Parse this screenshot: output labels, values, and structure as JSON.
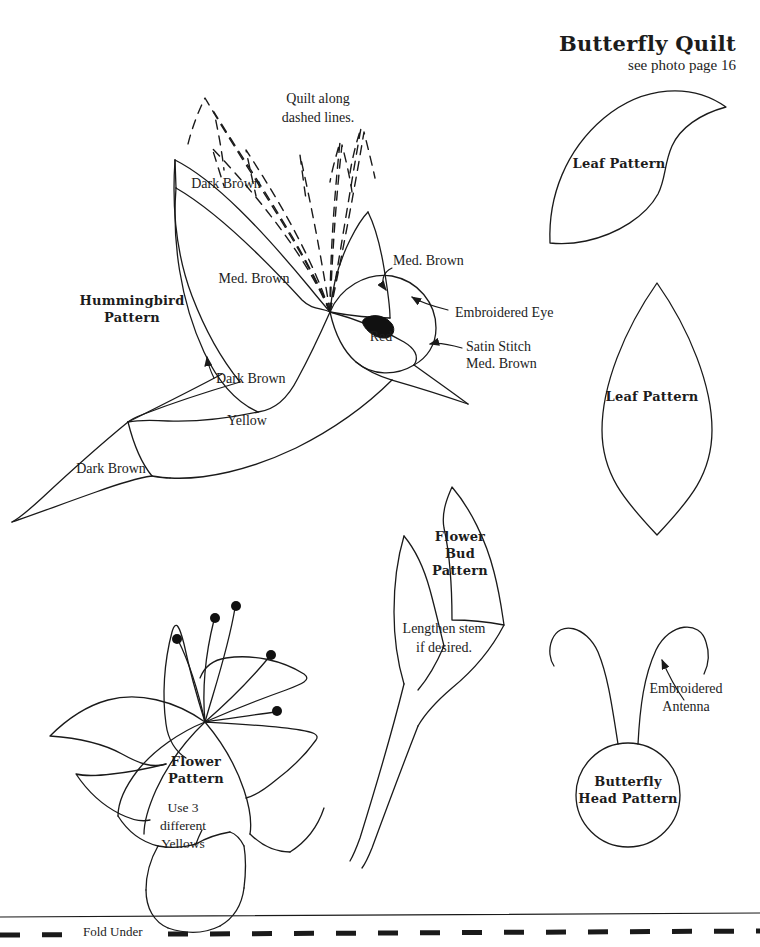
{
  "page": {
    "background": "#ffffff",
    "ink": "#1a1a1a",
    "width": 760,
    "height": 947
  },
  "header": {
    "title": "Butterfly Quilt",
    "subtitle": "see photo page 16"
  },
  "hummingbird": {
    "pattern_label_line1": "Hummingbird",
    "pattern_label_line2": "Pattern",
    "quilt_note_line1": "Quilt along",
    "quilt_note_line2": "dashed lines.",
    "wing_upper_label": "Dark Brown",
    "wing_main_label": "Med. Brown",
    "head_label": "Med. Brown",
    "eye_label": "Embroidered Eye",
    "eye_fill_label": "Red",
    "beak_label_line1": "Satin Stitch",
    "beak_label_line2": "Med. Brown",
    "wing_arrow_label": "Dark Brown",
    "body_label": "Yellow",
    "tail_label": "Dark Brown"
  },
  "leaf_top": {
    "label": "Leaf Pattern"
  },
  "leaf_bottom": {
    "label": "Leaf Pattern"
  },
  "flower_bud": {
    "label_line1": "Flower",
    "label_line2": "Bud",
    "label_line3": "Pattern",
    "note_line1": "Lengthen stem",
    "note_line2": "if desired."
  },
  "flower": {
    "label_line1": "Flower",
    "label_line2": "Pattern",
    "note_line1": "Use 3",
    "note_line2": "different",
    "note_line3": "Yellows"
  },
  "butterfly_head": {
    "label_line1": "Butterfly",
    "label_line2": "Head Pattern",
    "antenna_label_line1": "Embroidered",
    "antenna_label_line2": "Antenna"
  },
  "footer": {
    "fold_label": "Fold Under"
  }
}
